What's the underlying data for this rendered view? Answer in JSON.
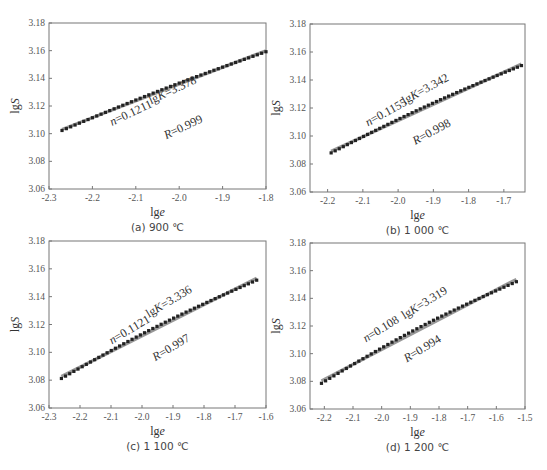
{
  "figure": {
    "panels": [
      {
        "id": "a",
        "caption": "(a) 900 ℃",
        "frame": {
          "left": 49,
          "top": 23,
          "right": 266,
          "bottom": 189
        },
        "annotations": {
          "n": "n=0.1211",
          "lgK": "lgK=3.378",
          "R": "R=0.999"
        }
      },
      {
        "id": "b",
        "caption": "(b) 1 000 ℃",
        "frame": {
          "left": 310,
          "top": 24,
          "right": 525,
          "bottom": 192
        },
        "annotations": {
          "n": "n=0.1155",
          "lgK": "lgK=3.342",
          "R": "R=0.998"
        }
      },
      {
        "id": "c",
        "caption": "(c) 1 100 ℃",
        "frame": {
          "left": 49,
          "top": 241,
          "right": 266,
          "bottom": 408
        },
        "annotations": {
          "n": "n=0.1121",
          "lgK": "lgK=3.336",
          "R": "R=0.997"
        }
      },
      {
        "id": "d",
        "caption": "(d) 1 200 ℃",
        "frame": {
          "left": 310,
          "top": 243,
          "right": 525,
          "bottom": 409
        },
        "annotations": {
          "n": "n=0.108",
          "lgK": "lgK=3.319",
          "R": "R=0.994"
        }
      }
    ],
    "colors": {
      "axis": "#777777",
      "markers": "#222222",
      "fit_line": "#999999",
      "text": "#333333"
    }
  },
  "chart_data": [
    {
      "type": "scatter",
      "title": "(a) 900 ℃",
      "xlabel": "lge",
      "ylabel": "lgS",
      "xlim": [
        -2.3,
        -1.8
      ],
      "ylim": [
        3.06,
        3.18
      ],
      "xticks": [
        "-2.3",
        "-2.2",
        "-2.1",
        "-2.0",
        "-1.9",
        "-1.8"
      ],
      "yticks": [
        "3.06",
        "3.08",
        "3.10",
        "3.12",
        "3.14",
        "3.16",
        "3.18"
      ],
      "grid": false,
      "series": [
        {
          "name": "measured",
          "x_range": [
            -2.27,
            -1.8
          ],
          "y_range": [
            3.103,
            3.16
          ]
        },
        {
          "name": "linear fit",
          "slope": 0.1211,
          "intercept": 3.378,
          "R": 0.999
        }
      ],
      "annotations": [
        "n=0.1211",
        "lgK=3.378",
        "R=0.999"
      ]
    },
    {
      "type": "scatter",
      "title": "(b) 1 000 ℃",
      "xlabel": "lge",
      "ylabel": "lgS",
      "xlim": [
        -2.25,
        -1.64
      ],
      "ylim": [
        3.06,
        3.18
      ],
      "xticks": [
        "-2.2",
        "-2.1",
        "-2.0",
        "-1.9",
        "-1.8",
        "-1.7"
      ],
      "yticks": [
        "3.06",
        "3.08",
        "3.10",
        "3.12",
        "3.14",
        "3.16",
        "3.18"
      ],
      "grid": false,
      "series": [
        {
          "name": "measured",
          "x_range": [
            -2.19,
            -1.65
          ],
          "y_range": [
            3.088,
            3.15
          ]
        },
        {
          "name": "linear fit",
          "slope": 0.1155,
          "intercept": 3.342,
          "R": 0.998
        }
      ],
      "annotations": [
        "n=0.1155",
        "lgK=3.342",
        "R=0.998"
      ]
    },
    {
      "type": "scatter",
      "title": "(c) 1 100 ℃",
      "xlabel": "lge",
      "ylabel": "lgS",
      "xlim": [
        -2.3,
        -1.6
      ],
      "ylim": [
        3.06,
        3.18
      ],
      "xticks": [
        "-2.3",
        "-2.2",
        "-2.1",
        "-2.0",
        "-1.9",
        "-1.8",
        "-1.7",
        "-1.6"
      ],
      "yticks": [
        "3.06",
        "3.08",
        "3.10",
        "3.12",
        "3.14",
        "3.16",
        "3.18"
      ],
      "grid": false,
      "series": [
        {
          "name": "measured",
          "x_range": [
            -2.26,
            -1.63
          ],
          "y_range": [
            3.081,
            3.15
          ]
        },
        {
          "name": "linear fit",
          "slope": 0.1121,
          "intercept": 3.336,
          "R": 0.997
        }
      ],
      "annotations": [
        "n=0.1121",
        "lgK=3.336",
        "R=0.997"
      ]
    },
    {
      "type": "scatter",
      "title": "(d) 1 200 ℃",
      "xlabel": "lge",
      "ylabel": "lgS",
      "xlim": [
        -2.25,
        -1.5
      ],
      "ylim": [
        3.06,
        3.18
      ],
      "xticks": [
        "-2.2",
        "-2.1",
        "-2.0",
        "-1.9",
        "-1.8",
        "-1.7",
        "-1.6",
        "-1.5"
      ],
      "yticks": [
        "3.06",
        "3.08",
        "3.10",
        "3.12",
        "3.14",
        "3.16",
        "3.18"
      ],
      "grid": false,
      "series": [
        {
          "name": "measured",
          "x_range": [
            -2.21,
            -1.53
          ],
          "y_range": [
            3.076,
            3.149
          ]
        },
        {
          "name": "linear fit",
          "slope": 0.108,
          "intercept": 3.319,
          "R": 0.994
        }
      ],
      "annotations": [
        "n=0.108",
        "lgK=3.319",
        "R=0.994"
      ]
    }
  ]
}
